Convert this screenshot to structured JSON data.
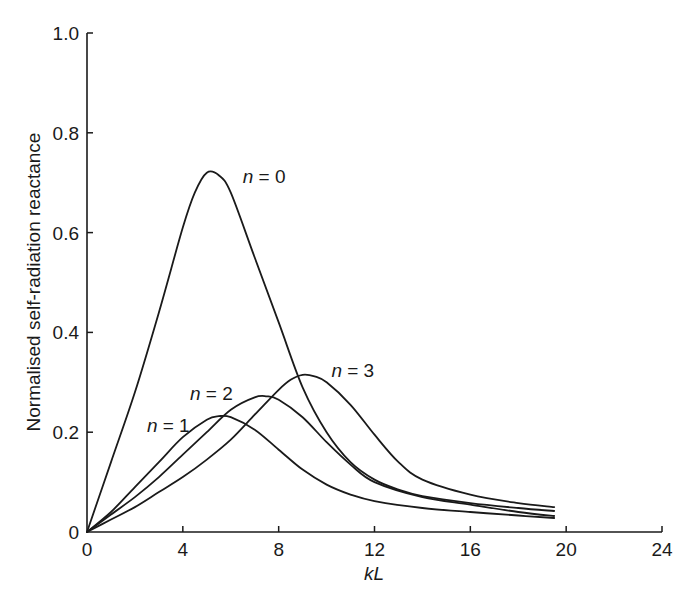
{
  "chart_data": {
    "type": "line",
    "title": "",
    "xlabel": "kL",
    "ylabel": "Normalised self-radiation reactance",
    "xlim": [
      0,
      24
    ],
    "ylim": [
      0,
      1.0
    ],
    "xticks": [
      0,
      4,
      8,
      12,
      16,
      20,
      24
    ],
    "yticks": [
      0,
      0.2,
      0.4,
      0.6,
      0.8,
      1.0
    ],
    "xtick_labels": [
      "0",
      "4",
      "8",
      "12",
      "16",
      "20",
      "24"
    ],
    "ytick_labels": [
      "0",
      "0.2",
      "0.4",
      "0.6",
      "0.8",
      "1.0"
    ],
    "grid": false,
    "legend": "inline labels",
    "series": [
      {
        "name": "n = 0",
        "label_pos": [
          6.5,
          0.7
        ],
        "x": [
          0,
          1,
          2,
          3,
          4,
          4.5,
          5,
          5.5,
          6,
          7,
          8,
          9,
          10,
          11,
          12,
          13,
          14,
          16,
          18,
          19.5
        ],
        "y": [
          0,
          0.14,
          0.28,
          0.44,
          0.61,
          0.68,
          0.72,
          0.715,
          0.68,
          0.55,
          0.42,
          0.29,
          0.2,
          0.14,
          0.105,
          0.085,
          0.072,
          0.058,
          0.048,
          0.042
        ]
      },
      {
        "name": "n = 1",
        "label_pos": [
          2.5,
          0.2
        ],
        "x": [
          0,
          1,
          2,
          3,
          4,
          5,
          5.5,
          6,
          7,
          8,
          9,
          10,
          11,
          12,
          14,
          16,
          18,
          19.5
        ],
        "y": [
          0,
          0.04,
          0.09,
          0.14,
          0.19,
          0.225,
          0.232,
          0.23,
          0.205,
          0.165,
          0.125,
          0.095,
          0.075,
          0.062,
          0.048,
          0.04,
          0.033,
          0.028
        ]
      },
      {
        "name": "n = 2",
        "label_pos": [
          4.3,
          0.265
        ],
        "x": [
          0,
          1,
          2,
          3,
          4,
          5,
          6,
          7,
          7.5,
          8,
          9,
          10,
          11,
          12,
          14,
          16,
          18,
          19.5
        ],
        "y": [
          0,
          0.035,
          0.07,
          0.11,
          0.155,
          0.2,
          0.245,
          0.27,
          0.272,
          0.265,
          0.23,
          0.18,
          0.135,
          0.1,
          0.07,
          0.055,
          0.04,
          0.032
        ]
      },
      {
        "name": "n = 3",
        "label_pos": [
          10.2,
          0.31
        ],
        "x": [
          0,
          1,
          2,
          3,
          4,
          5,
          6,
          7,
          8,
          8.5,
          9,
          9.5,
          10,
          11,
          12,
          13,
          14,
          16,
          18,
          19.5
        ],
        "y": [
          0,
          0.025,
          0.05,
          0.08,
          0.11,
          0.145,
          0.185,
          0.235,
          0.285,
          0.305,
          0.315,
          0.312,
          0.3,
          0.255,
          0.195,
          0.14,
          0.105,
          0.075,
          0.058,
          0.05
        ]
      }
    ]
  },
  "axes": {
    "xlabel": "kL",
    "ylabel": "Normalised self-radiation reactance"
  },
  "labels": {
    "n0": "n = 0",
    "n1": "n = 1",
    "n2": "n = 2",
    "n3": "n = 3"
  },
  "colors": {
    "line": "#1a1a1a",
    "background": "#ffffff"
  }
}
